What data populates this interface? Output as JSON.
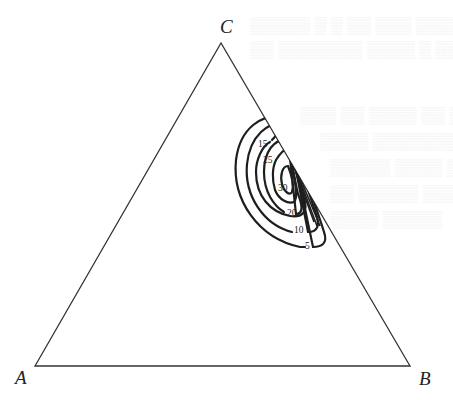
{
  "figure": {
    "type": "ternary contour plot",
    "vertices": [
      {
        "label": "A",
        "x": 35,
        "y": 366
      },
      {
        "label": "B",
        "x": 410,
        "y": 366
      },
      {
        "label": "C",
        "x": 221,
        "y": 43
      }
    ],
    "contour_labels": [
      "5",
      "10",
      "15",
      "20",
      "25",
      "30"
    ],
    "line_color": "#222222",
    "background": "#ffffff"
  },
  "labels": {
    "A": "A",
    "B": "B",
    "C": "C"
  },
  "contours": [
    {
      "level": "5",
      "label_x": 307,
      "label_y": 249
    },
    {
      "level": "10",
      "label_x": 298,
      "label_y": 233
    },
    {
      "level": "15",
      "label_x": 259,
      "label_y": 146
    },
    {
      "level": "20",
      "label_x": 289,
      "label_y": 216
    },
    {
      "level": "25",
      "label_x": 263,
      "label_y": 162
    },
    {
      "level": "30",
      "label_x": 278,
      "label_y": 191
    }
  ]
}
